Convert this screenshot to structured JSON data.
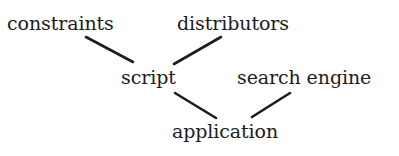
{
  "diagram": {
    "type": "tree",
    "width": 399,
    "height": 156,
    "background_color": "#ffffff",
    "stroke_color": "#1c1c1c",
    "text_color": "#1c1c1c",
    "nodes": [
      {
        "id": "constraints",
        "label": "constraints",
        "x": 7,
        "y": 14
      },
      {
        "id": "distributors",
        "label": "distributors",
        "x": 177,
        "y": 14
      },
      {
        "id": "script",
        "label": "script",
        "x": 121,
        "y": 68
      },
      {
        "id": "search_engine",
        "label": "search engine",
        "x": 237,
        "y": 68
      },
      {
        "id": "application",
        "label": "application",
        "x": 172,
        "y": 122
      }
    ],
    "edges": [
      {
        "from": "constraints",
        "to": "script",
        "x1": 86,
        "y1": 37,
        "x2": 133,
        "y2": 62
      },
      {
        "from": "distributors",
        "to": "script",
        "x1": 221,
        "y1": 37,
        "x2": 174,
        "y2": 64
      },
      {
        "from": "script",
        "to": "application",
        "x1": 175,
        "y1": 93,
        "x2": 216,
        "y2": 118
      },
      {
        "from": "search_engine",
        "to": "application",
        "x1": 290,
        "y1": 93,
        "x2": 252,
        "y2": 117
      }
    ]
  }
}
